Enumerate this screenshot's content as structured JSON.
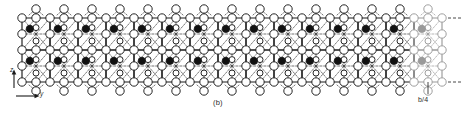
{
  "figure": {
    "caption": "(b)",
    "axes": {
      "vertical_label": "z",
      "horizontal_label": "y"
    },
    "dimension_label": "b/4",
    "structure": {
      "type": "crystal-structure-projection",
      "rows": 2,
      "columns": 15,
      "cell_width": 28,
      "cell_height": 32,
      "origin_x": 22,
      "origin_y": 18,
      "open_circle_radius": 4.2,
      "small_circle_radius": 3.0,
      "filled_circle_radius": 3.6,
      "colors": {
        "outline": "#1a1a1a",
        "fill_open": "#ffffff",
        "fill_closed": "#111111",
        "bond_dashed": "#3a3a3a",
        "faded": "#9a9a9a",
        "background": "#ffffff"
      },
      "legend_meaning": {
        "open_circle": "anion",
        "filled_circle": "cation",
        "dashed_line": "bond",
        "solid_line": "unit-cell-edge"
      },
      "faded_columns": [
        14
      ]
    }
  }
}
